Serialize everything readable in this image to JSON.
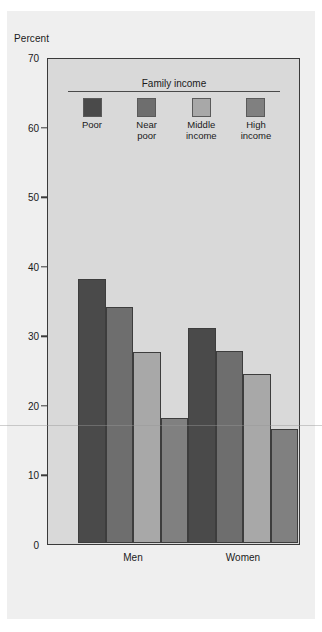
{
  "top_sliver_text": "",
  "chart_data": {
    "type": "bar",
    "title": "",
    "xlabel": "",
    "ylabel": "Percent",
    "ylim": [
      0,
      70
    ],
    "ytick_values": [
      70,
      60,
      50,
      40,
      30,
      20,
      10,
      0
    ],
    "ytick_labels": [
      "70",
      "60",
      "50",
      "40",
      "30",
      "20",
      "10",
      "0"
    ],
    "grid": false,
    "legend_title": "Family income",
    "legend_position": "inside-top",
    "categories": [
      "Men",
      "Women"
    ],
    "series": [
      {
        "name": "Poor",
        "label_lines": "Poor",
        "color": "#4a4a4a",
        "values": [
          38.0,
          31.0
        ]
      },
      {
        "name": "Near poor",
        "label_lines": "Near\npoor",
        "color": "#6e6e6e",
        "values": [
          34.0,
          27.7
        ]
      },
      {
        "name": "Middle income",
        "label_lines": "Middle\nincome",
        "color": "#a8a8a8",
        "values": [
          27.5,
          24.3
        ]
      },
      {
        "name": "High income",
        "label_lines": "High\nincome",
        "color": "#808080",
        "values": [
          18.0,
          16.5
        ]
      }
    ]
  },
  "colors": {
    "page_background": "#ffffff",
    "panel_background": "#efefef",
    "plot_background": "#d9d9d9",
    "axis_line": "#3a3a3a",
    "text": "#1a1a1a"
  }
}
